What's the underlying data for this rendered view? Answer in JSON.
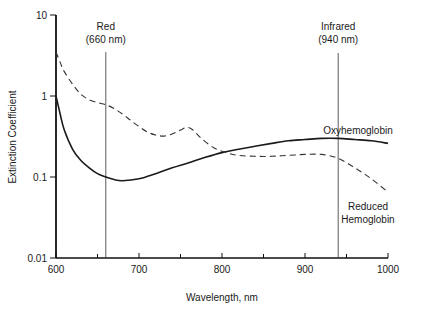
{
  "chart_data": {
    "type": "line",
    "title": "",
    "xlabel": "Wavelength, nm",
    "ylabel": "Extinction Coefficient",
    "xlim": [
      600,
      1000
    ],
    "ylim": [
      0.01,
      10
    ],
    "yscale": "log",
    "grid": false,
    "x_ticks": [
      600,
      700,
      800,
      900,
      1000
    ],
    "x_tick_labels": [
      "600",
      "700",
      "800",
      "900",
      "1000"
    ],
    "x_minor_ticks": [
      650,
      750,
      850,
      950
    ],
    "y_ticks": [
      10,
      1,
      0.1,
      0.01
    ],
    "y_tick_labels": [
      "10",
      "1",
      "0.1",
      "0.01"
    ],
    "reference_lines": [
      {
        "name": "red",
        "x": 660,
        "label_line1": "Red",
        "label_line2": "(660 nm)"
      },
      {
        "name": "infrared",
        "x": 940,
        "label_line1": "Infrared",
        "label_line2": "(940 nm)"
      }
    ],
    "series": [
      {
        "name": "Oxyhemoglobin",
        "style": "solid",
        "label_lines": [
          "Oxyhemoglobin"
        ],
        "points": [
          [
            600,
            1.0
          ],
          [
            605,
            0.6
          ],
          [
            610,
            0.38
          ],
          [
            620,
            0.22
          ],
          [
            630,
            0.16
          ],
          [
            640,
            0.13
          ],
          [
            650,
            0.11
          ],
          [
            660,
            0.1
          ],
          [
            670,
            0.093
          ],
          [
            680,
            0.09
          ],
          [
            700,
            0.095
          ],
          [
            720,
            0.11
          ],
          [
            740,
            0.13
          ],
          [
            760,
            0.15
          ],
          [
            780,
            0.175
          ],
          [
            800,
            0.2
          ],
          [
            820,
            0.22
          ],
          [
            840,
            0.24
          ],
          [
            860,
            0.26
          ],
          [
            880,
            0.28
          ],
          [
            900,
            0.29
          ],
          [
            920,
            0.3
          ],
          [
            940,
            0.3
          ],
          [
            960,
            0.29
          ],
          [
            980,
            0.28
          ],
          [
            1000,
            0.26
          ]
        ]
      },
      {
        "name": "Reduced Hemoglobin",
        "style": "dashed",
        "label_lines": [
          "Reduced",
          "Hemoglobin"
        ],
        "points": [
          [
            600,
            3.5
          ],
          [
            605,
            2.6
          ],
          [
            610,
            2.0
          ],
          [
            620,
            1.4
          ],
          [
            630,
            1.05
          ],
          [
            640,
            0.9
          ],
          [
            650,
            0.83
          ],
          [
            660,
            0.78
          ],
          [
            670,
            0.7
          ],
          [
            680,
            0.6
          ],
          [
            690,
            0.5
          ],
          [
            700,
            0.42
          ],
          [
            710,
            0.36
          ],
          [
            720,
            0.33
          ],
          [
            730,
            0.32
          ],
          [
            740,
            0.34
          ],
          [
            750,
            0.38
          ],
          [
            758,
            0.41
          ],
          [
            765,
            0.38
          ],
          [
            775,
            0.3
          ],
          [
            790,
            0.23
          ],
          [
            805,
            0.2
          ],
          [
            820,
            0.185
          ],
          [
            840,
            0.18
          ],
          [
            860,
            0.18
          ],
          [
            880,
            0.185
          ],
          [
            900,
            0.19
          ],
          [
            920,
            0.19
          ],
          [
            940,
            0.17
          ],
          [
            960,
            0.13
          ],
          [
            980,
            0.095
          ],
          [
            1000,
            0.065
          ]
        ]
      }
    ]
  }
}
